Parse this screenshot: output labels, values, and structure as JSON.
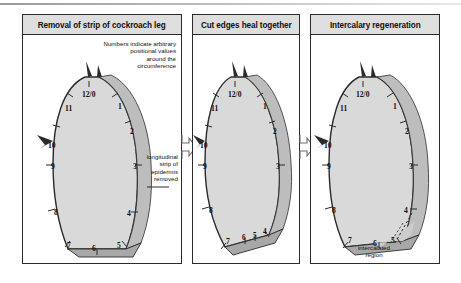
{
  "figure": {
    "type": "biology-diagram"
  },
  "panels": [
    {
      "id": "removal",
      "title": "Removal of strip of cockroach leg",
      "annotations": [
        {
          "name": "numbers-note",
          "text": "Numbers indicate arbitrary\npositional values\naround the\ncircumference"
        },
        {
          "name": "strip-note",
          "text": "longitudinal\nstrip of\nepidermis\nremoved"
        }
      ],
      "position_values": [
        "12/0",
        "11",
        "10",
        "9",
        "8",
        "7",
        "6",
        "5",
        "4",
        "3",
        "2",
        "1"
      ]
    },
    {
      "id": "heal",
      "title": "Cut edges heal together",
      "annotations": [],
      "position_values": [
        "12/0",
        "11",
        "10",
        "9",
        "8",
        "7",
        "6",
        "5",
        "4",
        "3",
        "2",
        "1"
      ]
    },
    {
      "id": "intercalary",
      "title": "Intercalary regeneration",
      "annotations": [
        {
          "name": "intercalated-note",
          "text": "intercalated\nregion"
        }
      ],
      "position_values": [
        "12/0",
        "11",
        "10",
        "9",
        "8",
        "7",
        "6",
        "5",
        "4",
        "3",
        "2",
        "1"
      ]
    }
  ],
  "arrows": [
    {
      "name": "arrow-removal-to-heal",
      "direction": "right"
    },
    {
      "name": "arrow-heal-to-intercalary",
      "direction": "right"
    }
  ],
  "colors": {
    "leg_fill": "#d9d9d9",
    "leg_shade": "#bdbdbd",
    "leg_dark": "#9a9a9a",
    "outline": "#2b2b2b",
    "header_bg": "#dedede",
    "background": "#ffffff"
  }
}
